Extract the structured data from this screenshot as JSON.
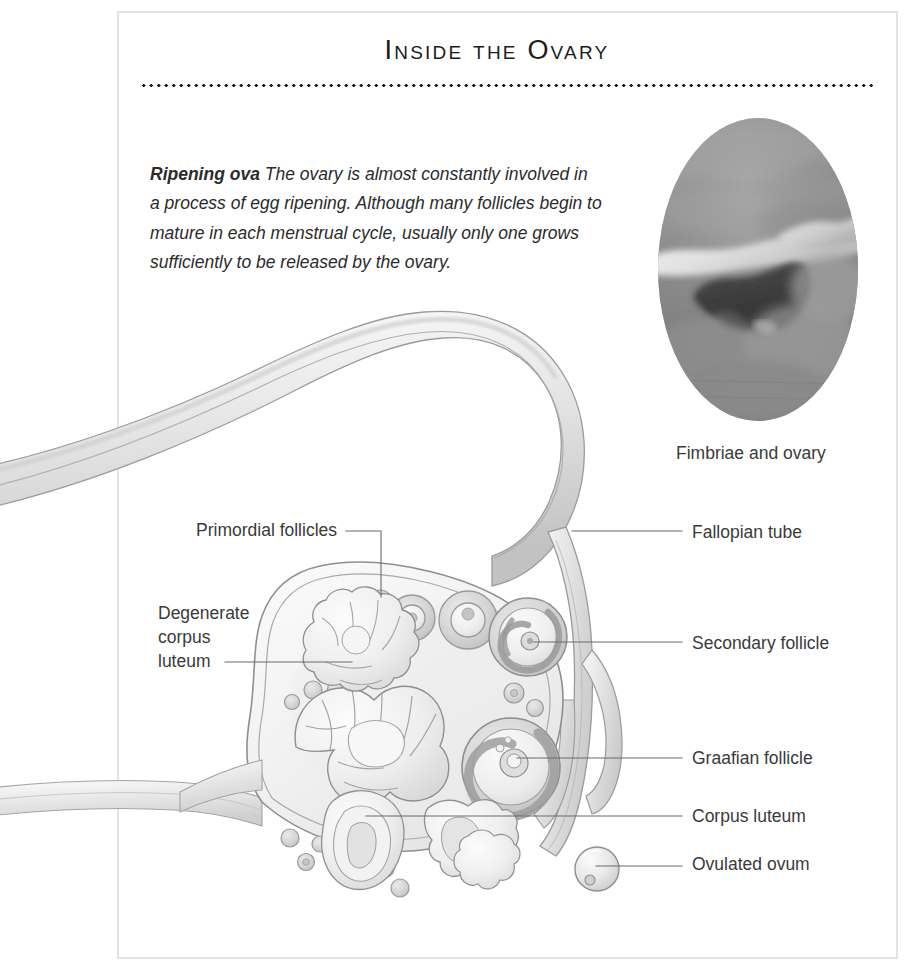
{
  "page": {
    "title": "Inside the Ovary",
    "frame_color": "#e3e3e3",
    "background_color": "#ffffff",
    "text_color": "#3a3a3a"
  },
  "intro": {
    "lead": "Ripening ova",
    "body": " The ovary is almost constantly involved in a process of egg ripening. Although many follicles begin to mature in each menstrual cycle, usually only one grows sufficiently to be released by the ovary."
  },
  "photo": {
    "caption": "Fimbriae and ovary",
    "shape": "circle",
    "kind": "endoscopic-photograph",
    "palette": [
      "#8d8d8d",
      "#a6a6a6",
      "#6f6f6f",
      "#3d3d3d",
      "#f2f2f2"
    ]
  },
  "labels": {
    "primordial_follicles": "Primordial follicles",
    "degenerate_corpus_luteum": "Degenerate corpus luteum",
    "fallopian_tube": "Fallopian tube",
    "secondary_follicle": "Secondary follicle",
    "graafian_follicle": "Graafian follicle",
    "corpus_luteum": "Corpus luteum",
    "ovulated_ovum": "Ovulated ovum"
  },
  "illustration": {
    "subject": "cross-section of ovary with fallopian tube",
    "style": "pencil-and-wash grayscale anatomical drawing",
    "line_color": "#8a8a8a",
    "fill_light": "#f4f4f4",
    "fill_mid": "#dcdcdc",
    "fill_dark": "#c3c3c3",
    "leader_color": "#5a5a5a"
  }
}
